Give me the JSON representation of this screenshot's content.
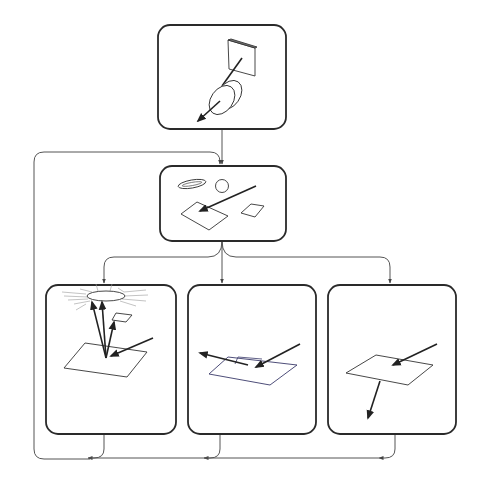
{
  "diagram": {
    "type": "flowchart",
    "colors": {
      "stroke": "#2a2a2a",
      "connector": "#555555",
      "background": "#ffffff"
    },
    "nodes": [
      {
        "id": "source",
        "label": "",
        "depicts": "light source (square) emitting ray through lens/disc",
        "icon": "lens-emitter-icon"
      },
      {
        "id": "incidence",
        "label": "",
        "depicts": "ray striking surface patch, with ellipse, sphere and second patch nearby",
        "icon": "incident-ray-icon"
      },
      {
        "id": "diffuse-reflection",
        "label": "",
        "depicts": "surface scattering rays up to glowing ellipse and small patch",
        "icon": "scatter-reflection-icon"
      },
      {
        "id": "specular-reflection",
        "label": "",
        "depicts": "ray reflecting off surface at mirrored angle",
        "icon": "specular-reflection-icon"
      },
      {
        "id": "transmission",
        "label": "",
        "depicts": "ray passing through surface and continuing below",
        "icon": "transmission-icon"
      }
    ],
    "edges": [
      {
        "from": "source",
        "to": "incidence"
      },
      {
        "from": "incidence",
        "to": "diffuse-reflection"
      },
      {
        "from": "incidence",
        "to": "specular-reflection"
      },
      {
        "from": "incidence",
        "to": "transmission"
      },
      {
        "from": "diffuse-reflection",
        "to": "incidence",
        "route": "loop back via bottom bus and left side"
      },
      {
        "from": "specular-reflection",
        "to": "bottom-bus"
      },
      {
        "from": "transmission",
        "to": "bottom-bus"
      }
    ]
  }
}
